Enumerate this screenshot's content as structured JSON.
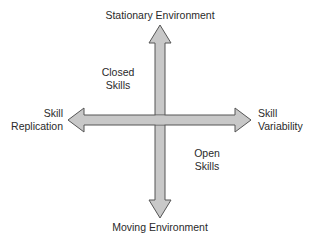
{
  "diagram": {
    "axes": {
      "vertical": {
        "top_label": "Stationary Environment",
        "bottom_label": "Moving Environment"
      },
      "horizontal": {
        "left_label_line1": "Skill",
        "left_label_line2": "Replication",
        "right_label_line1": "Skill",
        "right_label_line2": "Variability"
      }
    },
    "quadrants": {
      "upper_left_line1": "Closed",
      "upper_left_line2": "Skills",
      "lower_right_line1": "Open",
      "lower_right_line2": "Skills"
    },
    "colors": {
      "arrow_fill": "#c8c8c8",
      "arrow_stroke": "#555555",
      "text": "#2a2a2a"
    }
  }
}
